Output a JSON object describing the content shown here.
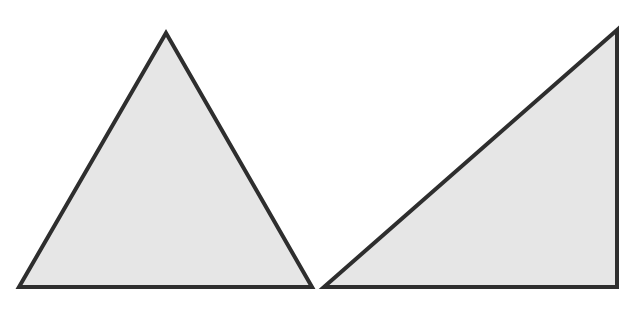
{
  "figure": {
    "background": "#ffffff",
    "fill_color": "#e6e6e6",
    "stroke_color": "#2e2e2e",
    "stroke_width": 4,
    "shapes": [
      {
        "name": "isosceles-triangle",
        "points": "166,33 19,287 312,287"
      },
      {
        "name": "right-triangle",
        "points": "617,30 324,287 617,287"
      }
    ]
  }
}
